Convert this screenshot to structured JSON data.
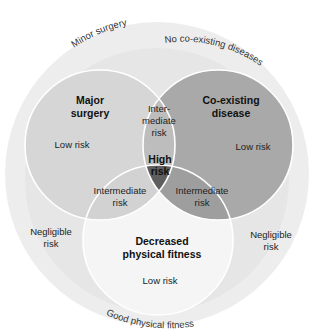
{
  "diagram": {
    "type": "venn",
    "outer_circle": {
      "arc_labels": {
        "top_left": "Minor surgery",
        "top_right": "No co-existing diseases",
        "bottom": "Good physical fitness"
      },
      "side_labels": {
        "left_line1": "Negligible",
        "left_line2": "risk",
        "right_line1": "Negligible",
        "right_line2": "risk"
      },
      "color": "#ececec"
    },
    "sets": [
      {
        "id": "major-surgery",
        "title_line1": "Major",
        "title_line2": "surgery",
        "risk": "Low risk",
        "color": "#d6d6d6"
      },
      {
        "id": "co-existing-disease",
        "title_line1": "Co-existing",
        "title_line2": "disease",
        "risk": "Low risk",
        "color": "#a9a9a9"
      },
      {
        "id": "decreased-physical-fitness",
        "title_line1": "Decreased",
        "title_line2": "physical fitness",
        "risk": "Low risk",
        "color": "#f4f4f4"
      }
    ],
    "intersections": {
      "surgery_disease": {
        "line1": "Inter-",
        "line2": "mediate",
        "line3": "risk",
        "color": "#bdbdbd"
      },
      "surgery_fitness": {
        "line1": "Intermediate",
        "line2": "risk",
        "color": "#d0d0d0"
      },
      "disease_fitness": {
        "line1": "Intermediate",
        "line2": "risk",
        "color": "#9d9d9d"
      },
      "all_three": {
        "line1": "High",
        "line2": "risk",
        "color": "#5e5e5e"
      }
    },
    "outline_color": "#ffffff"
  }
}
